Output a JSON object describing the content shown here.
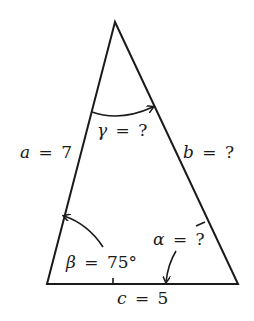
{
  "diagram": {
    "type": "triangle",
    "vertices": {
      "apex": [
        115,
        22
      ],
      "bottom_left": [
        47,
        284
      ],
      "bottom_right": [
        238,
        284
      ]
    },
    "sides": {
      "a": {
        "var": "a",
        "eq": "=",
        "value": "7"
      },
      "b": {
        "var": "b",
        "eq": "=",
        "value": "?"
      },
      "c": {
        "var": "c",
        "eq": "=",
        "value": "5"
      }
    },
    "angles": {
      "gamma": {
        "var": "γ",
        "eq": "=",
        "value": "?"
      },
      "beta": {
        "var": "β",
        "eq": "=",
        "value": "75°"
      },
      "alpha": {
        "var": "α",
        "eq": "=",
        "value": "?"
      }
    }
  }
}
